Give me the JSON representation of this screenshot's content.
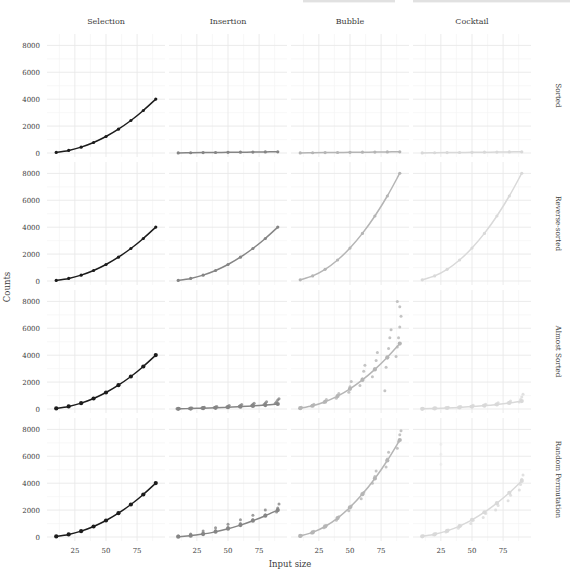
{
  "figure": {
    "xlabel": "Input size",
    "ylabel": "Counts",
    "column_headers": [
      "Selection",
      "Insertion",
      "Bubble",
      "Cocktail"
    ],
    "row_labels": [
      "Sorted",
      "Reverse-sorted",
      "Almost Sorted",
      "Random Permutation"
    ],
    "colors": {
      "Selection": "#1c1c1c",
      "Insertion": "#858585",
      "Bubble": "#b5b5b5",
      "Cocktail": "#d9d9d9"
    },
    "text_color": "#3d3d3d",
    "grid_major": "#e9e9e9",
    "grid_minor": "#f4f4f4"
  },
  "chart_data": {
    "type": "scatter",
    "title": "",
    "xlabel": "Input size",
    "ylabel": "Counts",
    "x": [
      10,
      20,
      30,
      40,
      50,
      60,
      70,
      80,
      90
    ],
    "xticks": [
      25,
      50,
      75
    ],
    "xminor": [
      12.5,
      37.5,
      62.5,
      87.5
    ],
    "yticks": [
      0,
      2000,
      4000,
      6000,
      8000
    ],
    "yminor": [
      1000,
      3000,
      5000,
      7000
    ],
    "ylim": [
      0,
      8400
    ],
    "legend": "none",
    "grid": "on",
    "columns": [
      "Selection",
      "Insertion",
      "Bubble",
      "Cocktail"
    ],
    "rows": [
      "Sorted",
      "Reverse-sorted",
      "Almost Sorted",
      "Random Permutation"
    ],
    "cells": [
      [
        {
          "curve": [
            45,
            190,
            435,
            780,
            1225,
            1770,
            2415,
            3160,
            4005
          ]
        },
        {
          "curve": [
            9,
            19,
            29,
            39,
            49,
            59,
            69,
            79,
            89
          ]
        },
        {
          "curve": [
            9,
            19,
            29,
            39,
            49,
            59,
            69,
            79,
            89
          ]
        },
        {
          "curve": [
            9,
            19,
            29,
            39,
            49,
            59,
            69,
            79,
            89
          ]
        }
      ],
      [
        {
          "curve": [
            45,
            190,
            435,
            780,
            1225,
            1770,
            2415,
            3160,
            4005
          ]
        },
        {
          "curve": [
            45,
            190,
            435,
            780,
            1225,
            1770,
            2415,
            3160,
            4005
          ]
        },
        {
          "curve": [
            90,
            380,
            870,
            1560,
            2450,
            3540,
            4830,
            6320,
            8010
          ]
        },
        {
          "curve": [
            90,
            380,
            870,
            1560,
            2450,
            3540,
            4830,
            6320,
            8010
          ]
        }
      ],
      [
        {
          "curve": [
            45,
            190,
            435,
            780,
            1225,
            1770,
            2415,
            3160,
            4005
          ]
        },
        {
          "curve": [
            15,
            35,
            60,
            90,
            130,
            175,
            230,
            295,
            370
          ],
          "points": [
            [
              9,
              20
            ],
            [
              11,
              35
            ],
            [
              19,
              45
            ],
            [
              21,
              70
            ],
            [
              29,
              75
            ],
            [
              30,
              105
            ],
            [
              31,
              130
            ],
            [
              39,
              110
            ],
            [
              40,
              150
            ],
            [
              41,
              185
            ],
            [
              49,
              155
            ],
            [
              50,
              205
            ],
            [
              51,
              255
            ],
            [
              59,
              205
            ],
            [
              60,
              265
            ],
            [
              61,
              330
            ],
            [
              69,
              265
            ],
            [
              70,
              345
            ],
            [
              71,
              430
            ],
            [
              79,
              340
            ],
            [
              80,
              440
            ],
            [
              81,
              545
            ],
            [
              88,
              420
            ],
            [
              89,
              540
            ],
            [
              90,
              660
            ],
            [
              91,
              760
            ]
          ]
        },
        {
          "curve": [
            60,
            240,
            540,
            960,
            1500,
            2160,
            2940,
            3840,
            4860
          ],
          "points": [
            [
              10,
              60
            ],
            [
              11,
              130
            ],
            [
              19,
              220
            ],
            [
              21,
              350
            ],
            [
              29,
              480
            ],
            [
              31,
              700
            ],
            [
              39,
              800
            ],
            [
              41,
              1150
            ],
            [
              49,
              1250
            ],
            [
              50,
              1650
            ],
            [
              51,
              2050
            ],
            [
              58,
              1750
            ],
            [
              60,
              2250
            ],
            [
              61,
              2800
            ],
            [
              62,
              3250
            ],
            [
              68,
              2400
            ],
            [
              70,
              3000
            ],
            [
              71,
              3600
            ],
            [
              72,
              4200
            ],
            [
              78,
              1350
            ],
            [
              79,
              3100
            ],
            [
              80,
              3800
            ],
            [
              81,
              4500
            ],
            [
              82,
              5300
            ],
            [
              83,
              5900
            ],
            [
              87,
              3900
            ],
            [
              88,
              4600
            ],
            [
              89,
              5300
            ],
            [
              90,
              6100
            ],
            [
              91,
              6900
            ],
            [
              90,
              7600
            ],
            [
              88,
              8000
            ]
          ]
        },
        {
          "curve": [
            15,
            40,
            75,
            120,
            180,
            250,
            340,
            450,
            590
          ],
          "points": [
            [
              10,
              15
            ],
            [
              11,
              35
            ],
            [
              19,
              45
            ],
            [
              21,
              75
            ],
            [
              29,
              85
            ],
            [
              31,
              130
            ],
            [
              39,
              130
            ],
            [
              41,
              190
            ],
            [
              49,
              190
            ],
            [
              51,
              270
            ],
            [
              59,
              260
            ],
            [
              61,
              360
            ],
            [
              69,
              340
            ],
            [
              71,
              470
            ],
            [
              79,
              440
            ],
            [
              81,
              600
            ],
            [
              88,
              520
            ],
            [
              89,
              700
            ],
            [
              90,
              900
            ],
            [
              91,
              1100
            ]
          ]
        }
      ],
      [
        {
          "curve": [
            45,
            190,
            435,
            780,
            1225,
            1770,
            2415,
            3160,
            4005
          ]
        },
        {
          "curve": [
            22,
            95,
            218,
            390,
            612,
            885,
            1208,
            1580,
            2002
          ],
          "points": [
            [
              10,
              35
            ],
            [
              10,
              75
            ],
            [
              20,
              140
            ],
            [
              20,
              230
            ],
            [
              30,
              300
            ],
            [
              30,
              440
            ],
            [
              40,
              480
            ],
            [
              40,
              680
            ],
            [
              50,
              720
            ],
            [
              50,
              950
            ],
            [
              60,
              1000
            ],
            [
              60,
              1280
            ],
            [
              70,
              1300
            ],
            [
              70,
              1620
            ],
            [
              80,
              1650
            ],
            [
              80,
              2000
            ],
            [
              89,
              1850
            ],
            [
              90,
              2150
            ],
            [
              91,
              2450
            ]
          ]
        },
        {
          "curve": [
            81,
            342,
            783,
            1404,
            2205,
            3186,
            4347,
            5688,
            7209
          ],
          "points": [
            [
              10,
              60
            ],
            [
              11,
              120
            ],
            [
              19,
              300
            ],
            [
              21,
              420
            ],
            [
              29,
              680
            ],
            [
              31,
              850
            ],
            [
              39,
              1250
            ],
            [
              41,
              1500
            ],
            [
              49,
              1950
            ],
            [
              51,
              2300
            ],
            [
              59,
              2850
            ],
            [
              61,
              3300
            ],
            [
              68,
              4000
            ],
            [
              70,
              4500
            ],
            [
              71,
              4900
            ],
            [
              79,
              5200
            ],
            [
              80,
              5800
            ],
            [
              81,
              6300
            ],
            [
              88,
              6600
            ],
            [
              89,
              7100
            ],
            [
              90,
              7600
            ],
            [
              91,
              7900
            ]
          ]
        },
        {
          "curve": [
            47,
            198,
            452,
            811,
            1274,
            1841,
            2513,
            3289,
            4169
          ],
          "points": [
            [
              10,
              40
            ],
            [
              11,
              90
            ],
            [
              19,
              170
            ],
            [
              21,
              260
            ],
            [
              29,
              380
            ],
            [
              31,
              520
            ],
            [
              39,
              650
            ],
            [
              41,
              830
            ],
            [
              49,
              1000
            ],
            [
              51,
              1250
            ],
            [
              59,
              1450
            ],
            [
              61,
              1750
            ],
            [
              69,
              2000
            ],
            [
              71,
              2350
            ],
            [
              79,
              2700
            ],
            [
              81,
              3100
            ],
            [
              88,
              3500
            ],
            [
              89,
              3900
            ],
            [
              90,
              4300
            ],
            [
              91,
              4600
            ]
          ],
          "faint_points": [
            [
              25,
              6900
            ],
            [
              25,
              6150
            ],
            [
              25,
              5400
            ]
          ]
        }
      ]
    ]
  },
  "decor": {
    "top_edge_marks": [
      {
        "x": 303,
        "w": 92
      },
      {
        "x": 413,
        "w": 157
      }
    ]
  }
}
